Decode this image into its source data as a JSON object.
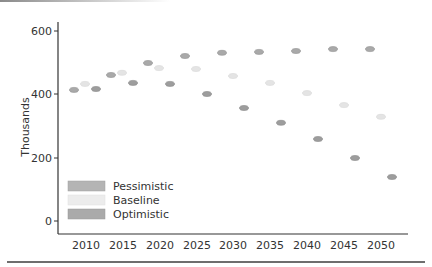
{
  "chart_data": {
    "type": "scatter",
    "title": "",
    "xlabel": "",
    "ylabel": "Thousands",
    "ylim": [
      0,
      600
    ],
    "yticks": [
      0,
      200,
      400,
      600
    ],
    "categories": [
      "2010",
      "2015",
      "2020",
      "2025",
      "2030",
      "2035",
      "2040",
      "2045",
      "2050"
    ],
    "grid": false,
    "legend_position": "lower-left inside",
    "series": [
      {
        "name": "Pessimistic",
        "color": "#a9a9a9",
        "values": [
          414,
          461,
          499,
          521,
          531,
          534,
          537,
          543,
          543
        ]
      },
      {
        "name": "Baseline",
        "color": "#e4e4e4",
        "values": [
          433,
          468,
          483,
          480,
          458,
          436,
          404,
          366,
          329
        ]
      },
      {
        "name": "Optimistic",
        "color": "#9d9d9d",
        "values": [
          417,
          436,
          433,
          401,
          357,
          310,
          259,
          199,
          139
        ]
      }
    ]
  },
  "axis": {
    "y_title": "Thousands",
    "y_ticks": [
      "0",
      "200",
      "400",
      "600"
    ],
    "x_ticks": [
      "2010",
      "2015",
      "2020",
      "2025",
      "2030",
      "2035",
      "2040",
      "2045",
      "2050"
    ]
  },
  "legend": {
    "items": [
      {
        "label": "Pessimistic",
        "color": "#b4b4b4"
      },
      {
        "label": "Baseline",
        "color": "#ececec"
      },
      {
        "label": "Optimistic",
        "color": "#aaaaaa"
      }
    ]
  }
}
